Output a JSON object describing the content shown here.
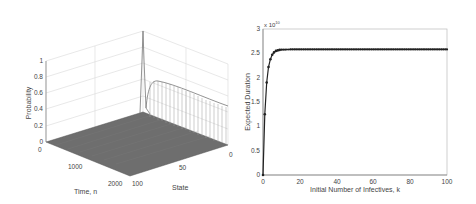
{
  "chart_data": [
    {
      "type": "surface",
      "title": "",
      "xlabel": "State",
      "ylabel": "Time, n",
      "zlabel": "Probability",
      "x_ticks": [
        "0",
        "50",
        "100"
      ],
      "y_ticks": [
        "0",
        "1000",
        "2000"
      ],
      "z_ticks": [
        "0",
        "0.2",
        "0.4",
        "0.6",
        "0.8",
        "1"
      ],
      "x_range": [
        0,
        100
      ],
      "y_range": [
        0,
        2000
      ],
      "z_range": [
        0,
        1
      ],
      "grid": true,
      "description": "Probability distribution over states vs time: sharp spike to 1 at time 0, then mass concentrates at state 0 rising to about 0.73 and slowly decaying toward ~0.45 by n=2000; all other states near 0",
      "features": {
        "initial_spike": 1.0,
        "state0_peak": 0.73,
        "state0_at_n2000": 0.45
      }
    },
    {
      "type": "line",
      "title": "",
      "xlabel": "Initial Number of Infectives, k",
      "ylabel": "Expected Duration",
      "y_multiplier": "x 10^10",
      "x_ticks": [
        "0",
        "20",
        "40",
        "60",
        "80",
        "100"
      ],
      "y_ticks": [
        "0",
        "0.5",
        "1",
        "1.5",
        "2",
        "2.5",
        "3"
      ],
      "xlim": [
        0,
        100
      ],
      "ylim": [
        0,
        3
      ],
      "grid": false,
      "marker": "*",
      "series": [
        {
          "name": "Expected Duration",
          "x": [
            0,
            1,
            2,
            3,
            4,
            5,
            6,
            7,
            8,
            9,
            10,
            15,
            20,
            30,
            40,
            50,
            60,
            70,
            80,
            90,
            100
          ],
          "values": [
            0,
            1.25,
            1.9,
            2.22,
            2.38,
            2.47,
            2.52,
            2.55,
            2.56,
            2.57,
            2.575,
            2.58,
            2.58,
            2.58,
            2.58,
            2.58,
            2.58,
            2.58,
            2.58,
            2.58,
            2.58
          ]
        }
      ]
    }
  ]
}
